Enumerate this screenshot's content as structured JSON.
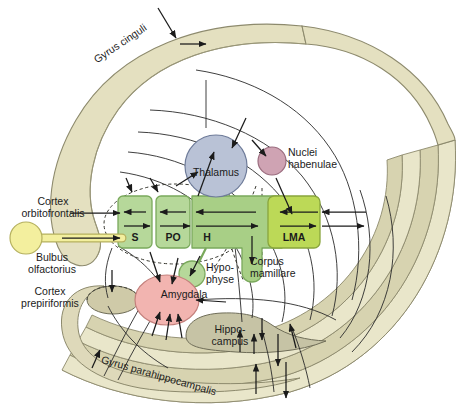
{
  "figure": {
    "background": "#ffffff"
  },
  "colors": {
    "gyrus_band_fill": "#e4e0c0",
    "gyrus_band_fill_dark": "#d4cfae",
    "gyrus_band_stroke": "#8d8a6d",
    "hippocampus_fill": "#c6c3a5",
    "hippocampus_stroke": "#6f6d58",
    "thalamus_fill": "#b9c2d6",
    "thalamus_stroke": "#6e7b99",
    "habenulae_fill": "#cfa3b3",
    "habenulae_stroke": "#9a6c7e",
    "amygdala_fill": "#f2b4b0",
    "amygdala_stroke": "#c4807c",
    "bulbus_fill": "#f3ef9e",
    "bulbus_stroke": "#b5b05e",
    "box_green": "#b6d89a",
    "box_green_stroke": "#7aa95c",
    "box_green_bright": "#bcd957",
    "box_green_bright_stroke": "#89a53c",
    "box_green_mid": "#a8cf86",
    "arrow": "#1b1b1b",
    "text": "#1b1b1b"
  },
  "labels": {
    "gyrus_cinguli": "Gyrus cinguli",
    "gyrus_parahippocampalis": "Gyrus parahippocampalis",
    "cortex_orbitofrontalis": "Cortex\norbitofrontalis",
    "cortex_prepiriformis": "Cortex\nprepiriformis",
    "bulbus_olfactorius": "Bulbus\nolfactorius",
    "thalamus": "Thalamus",
    "nuclei_habenulae": "Nuclei\nhabenulae",
    "amygdala": "Amygdala",
    "hypophyse": "Hypo-\nphyse",
    "corpus_mamillare": "Corpus\nmamillare",
    "hippocampus": "Hippo-\ncampus",
    "box_s": "S",
    "box_po": "PO",
    "box_h": "H",
    "box_lma": "LMA"
  },
  "structures": [
    {
      "key": "gyrus_cinguli",
      "kind": "band",
      "label": "Gyrus cinguli"
    },
    {
      "key": "gyrus_parahippocampalis",
      "kind": "band",
      "label": "Gyrus parahippocampalis"
    },
    {
      "key": "thalamus",
      "kind": "nucleus",
      "label": "Thalamus",
      "fill": "#b9c2d6"
    },
    {
      "key": "nuclei_habenulae",
      "kind": "nucleus",
      "label": "Nuclei habenulae",
      "fill": "#cfa3b3"
    },
    {
      "key": "amygdala",
      "kind": "nucleus",
      "label": "Amygdala",
      "fill": "#f2b4b0"
    },
    {
      "key": "hippocampus",
      "kind": "nucleus",
      "label": "Hippocampus",
      "fill": "#c6c3a5"
    },
    {
      "key": "bulbus_olfactorius",
      "kind": "nucleus",
      "label": "Bulbus olfactorius",
      "fill": "#f3ef9e"
    },
    {
      "key": "hypophyse",
      "kind": "nucleus",
      "label": "Hypophyse",
      "fill": "#b6d89a"
    },
    {
      "key": "corpus_mamillare",
      "kind": "nucleus",
      "label": "Corpus mamillare",
      "fill": "#a8cf86"
    },
    {
      "key": "box_s",
      "kind": "box",
      "label": "S",
      "fill": "#b6d89a"
    },
    {
      "key": "box_po",
      "kind": "box",
      "label": "PO",
      "fill": "#b6d89a"
    },
    {
      "key": "box_h",
      "kind": "box",
      "label": "H",
      "fill": "#a8cf86"
    },
    {
      "key": "box_lma",
      "kind": "box",
      "label": "LMA",
      "fill": "#bcd957"
    }
  ]
}
